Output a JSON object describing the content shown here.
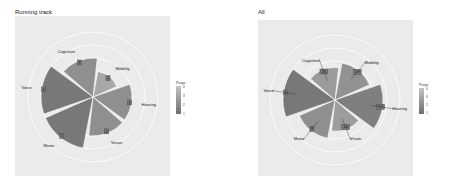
{
  "chart_data": [
    {
      "type": "bar",
      "subtype": "polar",
      "title": "Running track",
      "categories": [
        "Mobility",
        "Hearing",
        "Vision",
        "Motor",
        "Voice",
        "Cognition"
      ],
      "values": [
        2,
        3,
        3,
        4,
        4,
        3
      ],
      "value_labels": [
        "2",
        "3",
        "3",
        "4",
        "4",
        "3"
      ],
      "fill_by": "Purge",
      "legend": {
        "title": "Purge",
        "ticks": [
          "4",
          "3",
          "2",
          "1"
        ],
        "position": "right"
      },
      "rlim": [
        0,
        5
      ],
      "grid": true
    },
    {
      "type": "bar",
      "subtype": "polar",
      "title": "All",
      "categories": [
        "Mobility",
        "Hearing",
        "Vision",
        "Motor",
        "Voice",
        "Cognition"
      ],
      "values": [
        2.9,
        3.7,
        2.4,
        3,
        4,
        2.5
      ],
      "value_labels": [
        "2.9",
        "3.7",
        "2.4",
        "3",
        "4",
        "2.5"
      ],
      "error_bars": true,
      "fill_by": "Purge",
      "legend": {
        "title": "Purge",
        "ticks": [
          "4",
          "3",
          "2",
          "1"
        ],
        "position": "right"
      },
      "rlim": [
        0,
        5
      ],
      "grid": true
    }
  ],
  "panels": {
    "left": {
      "title": "Running track"
    },
    "right": {
      "title": "All"
    }
  }
}
